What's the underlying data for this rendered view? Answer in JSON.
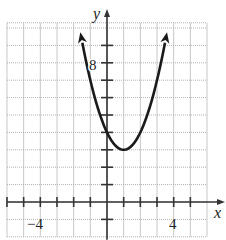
{
  "chart_data": {
    "type": "line",
    "title": "",
    "function": "y = x^2 - 2x + 4",
    "xlabel": "x",
    "ylabel": "y",
    "xlim": [
      -6,
      6
    ],
    "ylim": [
      -2,
      10.3
    ],
    "grid": true,
    "x_tick_labels": [
      {
        "value": -4,
        "label": "−4"
      },
      {
        "value": 4,
        "label": "4"
      }
    ],
    "y_tick_labels": [
      {
        "value": 8,
        "label": "8"
      }
    ],
    "x_ticks": [
      -6,
      -5,
      -4,
      -3,
      -2,
      -1,
      1,
      2,
      3,
      4,
      5
    ],
    "y_ticks": [
      -1,
      1,
      2,
      3,
      4,
      5,
      6,
      7,
      8,
      9
    ],
    "series": [
      {
        "name": "parabola",
        "color": "#1a1a1a",
        "arrows_at_ends": true,
        "x": [
          -1.6,
          -1,
          0,
          1,
          2,
          3,
          3.6
        ],
        "values": [
          9.76,
          7,
          4,
          3,
          4,
          7,
          9.76
        ]
      }
    ],
    "vertex": [
      1,
      3
    ],
    "y_intercept": [
      0,
      4
    ]
  },
  "labels": {
    "x_axis": "x",
    "y_axis": "y",
    "tick_neg4": "−4",
    "tick_4": "4",
    "tick_8": "8"
  }
}
